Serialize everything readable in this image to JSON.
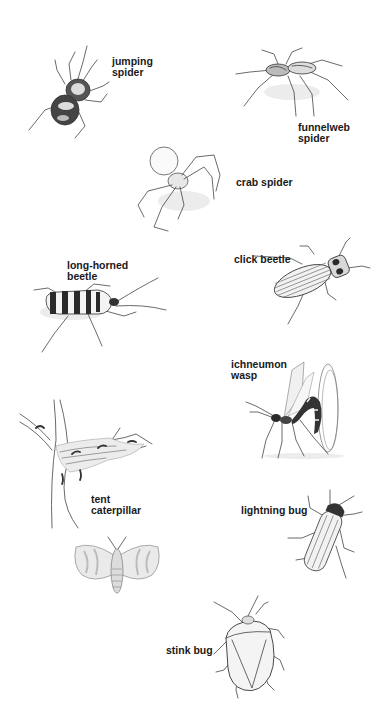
{
  "plate": {
    "background": "#ffffff",
    "label_color": "#1a1a1a",
    "specimens": [
      {
        "id": "jumping-spider",
        "label_lines": [
          "jumping",
          "spider"
        ]
      },
      {
        "id": "funnelweb-spider",
        "label_lines": [
          "funnelweb",
          "spider"
        ]
      },
      {
        "id": "crab-spider",
        "label_lines": [
          "crab spider"
        ]
      },
      {
        "id": "long-horned-beetle",
        "label_lines": [
          "long-horned",
          "beetle"
        ]
      },
      {
        "id": "click-beetle",
        "label_lines": [
          "click beetle"
        ]
      },
      {
        "id": "ichneumon-wasp",
        "label_lines": [
          "ichneumon",
          "wasp"
        ]
      },
      {
        "id": "tent-caterpillar",
        "label_lines": [
          "tent",
          "caterpillar"
        ]
      },
      {
        "id": "lightning-bug",
        "label_lines": [
          "lightning bug"
        ]
      },
      {
        "id": "stink-bug",
        "label_lines": [
          "stink bug"
        ]
      }
    ]
  }
}
